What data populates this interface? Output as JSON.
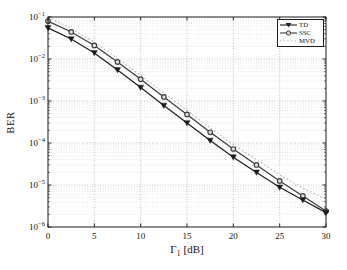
{
  "figure": {
    "background": "#ffffff",
    "frame_color": "#1b1b1b",
    "grid_major_color": "#a8a8a8",
    "grid_minor_color": "#d2d2d2"
  },
  "axis": {
    "ylabel": "BER",
    "xlabel": {
      "symbol": "Γ",
      "subscript": "1",
      "unit": "[dB]"
    },
    "x_tick_labels": [
      "0",
      "5",
      "10",
      "15",
      "20",
      "25",
      "30"
    ],
    "y_tick_base": "10",
    "y_tick_exponents": [
      "−1",
      "−2",
      "−3",
      "−4",
      "−5",
      "−6"
    ]
  },
  "legend": {
    "entries": [
      {
        "label": "TD"
      },
      {
        "label": "SSC"
      },
      {
        "label": "MVD"
      }
    ]
  },
  "chart_data": {
    "type": "line",
    "title": "",
    "xlabel": "Γ1 [dB]",
    "ylabel": "BER",
    "x_axis": {
      "min": 0,
      "max": 30,
      "ticks": [
        0,
        5,
        10,
        15,
        20,
        25,
        30
      ]
    },
    "y_axis": {
      "scale": "log",
      "min": 1e-06,
      "max": 0.1,
      "tick_exponents": [
        -1,
        -2,
        -3,
        -4,
        -5,
        -6
      ],
      "exp_top": -1,
      "exp_bottom": -6
    },
    "grid": {
      "major": true,
      "minor": true,
      "style": "dotted"
    },
    "legend_position": "top-right",
    "x": [
      0,
      2.5,
      5,
      7.5,
      10,
      12.5,
      15,
      17.5,
      20,
      22.5,
      25,
      27.5,
      30
    ],
    "series": [
      {
        "name": "TD",
        "marker": "triangle-down",
        "line_style": "solid",
        "color": "#1c1c1c",
        "values": [
          0.055,
          0.03,
          0.014,
          0.0055,
          0.0021,
          0.00078,
          0.0003,
          0.000115,
          4.6e-05,
          2e-05,
          8.8e-06,
          4.4e-06,
          2.2e-06
        ]
      },
      {
        "name": "SSC",
        "marker": "circle",
        "line_style": "solid",
        "color": "#3b3b3b",
        "values": [
          0.08,
          0.044,
          0.021,
          0.0085,
          0.0033,
          0.00125,
          0.00048,
          0.00018,
          7.2e-05,
          3e-05,
          1.25e-05,
          5.5e-06,
          2.4e-06
        ]
      },
      {
        "name": "MVD",
        "marker": "none",
        "line_style": "dotted",
        "color": "#bcbcbc",
        "values": [
          0.1,
          0.053,
          0.025,
          0.0103,
          0.0041,
          0.00155,
          0.0006,
          0.00023,
          9.2e-05,
          4e-05,
          1.75e-05,
          8.5e-06,
          4.6e-06
        ]
      }
    ]
  }
}
